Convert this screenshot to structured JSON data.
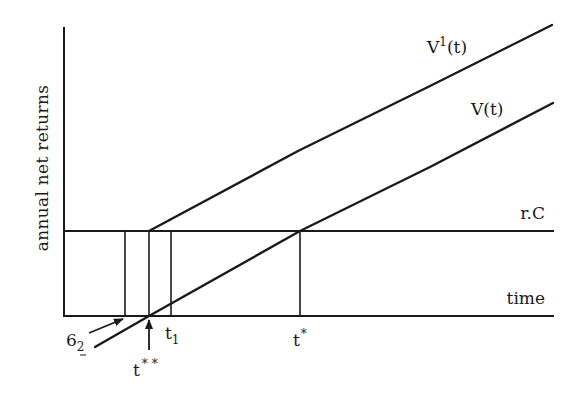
{
  "diagram": {
    "type": "economic-timing-diagram",
    "y_axis_label": "annual net returns",
    "x_axis_label": "time",
    "horizontal_line_label": "r.C",
    "curves": [
      {
        "name": "V1",
        "label_main": "V",
        "label_sup": "1",
        "label_tail": "(t)",
        "full_label": "V¹(t)"
      },
      {
        "name": "V",
        "label": "V(t)"
      }
    ],
    "markers": {
      "six_two": {
        "main": "6",
        "sub": "2"
      },
      "t_double_star": {
        "main": "t",
        "sup": "* *"
      },
      "t_one": {
        "main": "t",
        "sub": "1"
      },
      "t_star": {
        "main": "t",
        "sup": "*"
      }
    },
    "colors": {
      "line": "#1a1a1a",
      "background": "#ffffff"
    }
  }
}
